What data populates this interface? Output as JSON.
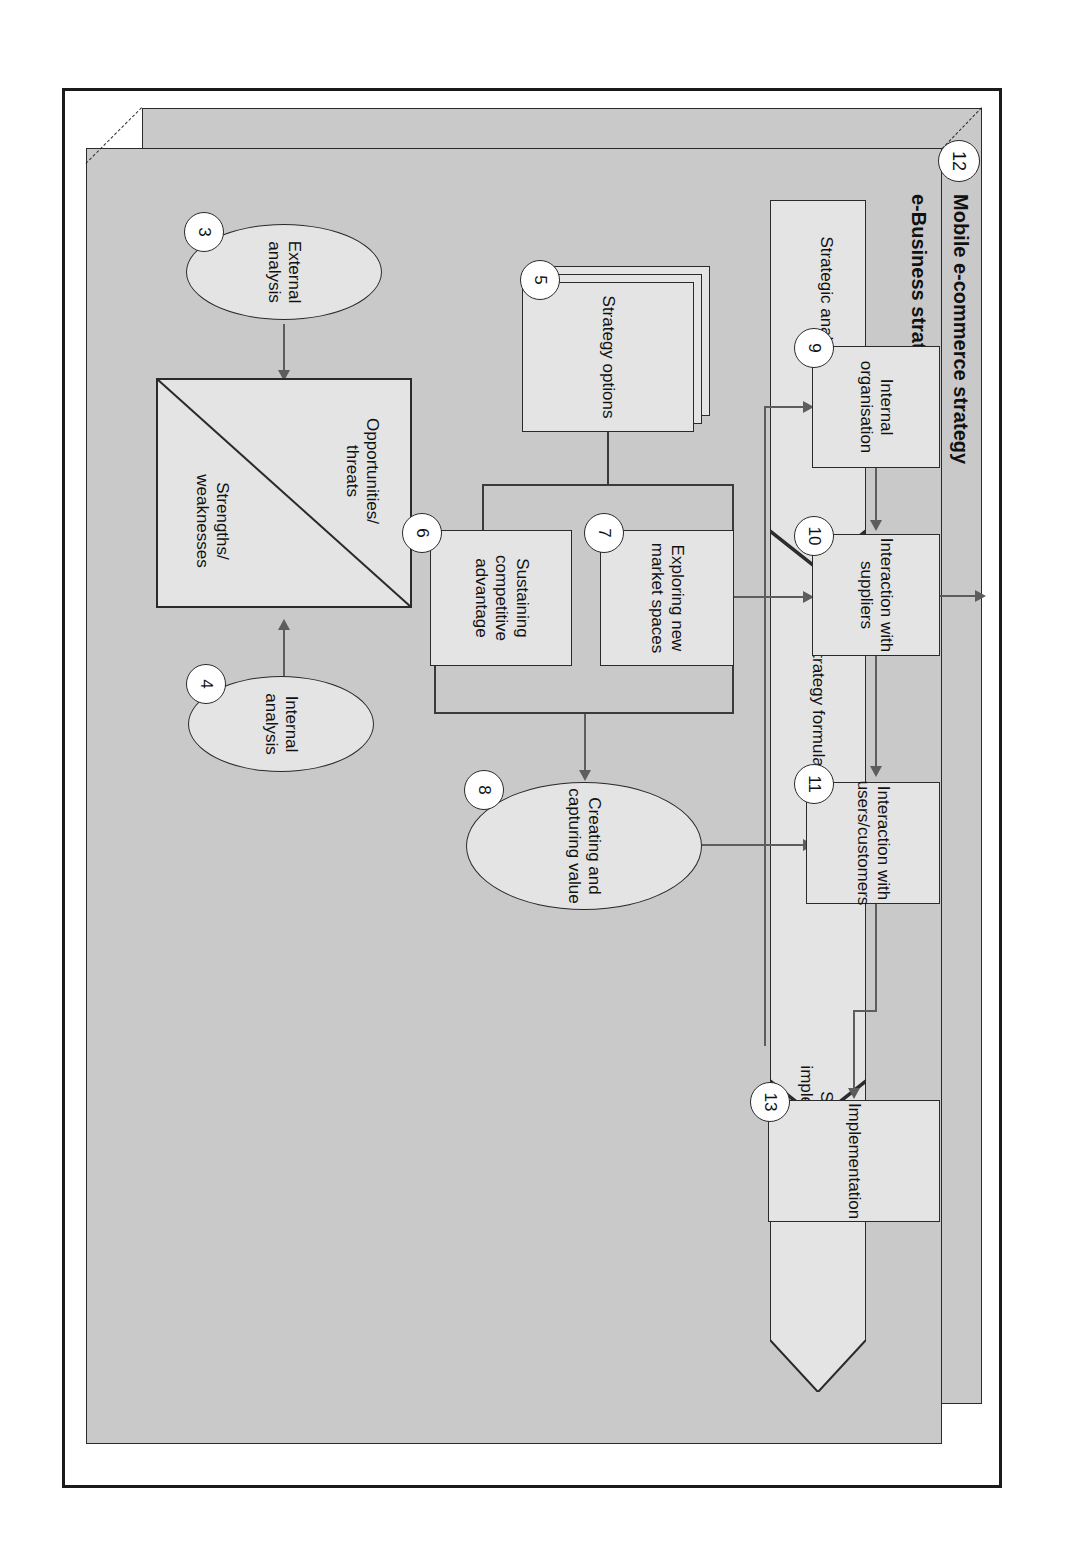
{
  "figure": {
    "back_panel_title": "Mobile e-commerce strategy",
    "back_panel_chapter": "12",
    "front_panel_title": "e-Business strategy"
  },
  "band": {
    "segments": [
      {
        "label": "Strategic analysis"
      },
      {
        "label": "Strategy formulation"
      },
      {
        "label": "Strategy implementation"
      }
    ]
  },
  "nodes": {
    "external_analysis": {
      "num": "3",
      "label": "External analysis",
      "shape": "ellipse"
    },
    "internal_analysis": {
      "num": "4",
      "label": "Internal analysis",
      "shape": "ellipse"
    },
    "strategy_options": {
      "num": "5",
      "label": "Strategy options",
      "shape": "stacked-rect"
    },
    "sustaining": {
      "num": "6",
      "label": "Sustaining competitive advantage",
      "shape": "rect"
    },
    "exploring": {
      "num": "7",
      "label": "Exploring new market spaces",
      "shape": "rect"
    },
    "value": {
      "num": "8",
      "label": "Creating and capturing value",
      "shape": "ellipse"
    },
    "internal_org": {
      "num": "9",
      "label": "Internal organisation",
      "shape": "rect"
    },
    "suppliers": {
      "num": "10",
      "label": "Interaction with suppliers",
      "shape": "rect"
    },
    "customers": {
      "num": "11",
      "label": "Interaction with users/customers",
      "shape": "rect"
    },
    "implementation": {
      "num": "13",
      "label": "Implementation",
      "shape": "rect"
    }
  },
  "swot": {
    "top_label": "Opportunities/ threats",
    "bottom_label": "Strengths/ weaknesses"
  },
  "colors": {
    "panel_fill": "#c9c9c9",
    "node_fill": "#e4e4e4",
    "outline": "#2a2a2a",
    "connector": "#5d5d5d",
    "page": "#ffffff"
  }
}
